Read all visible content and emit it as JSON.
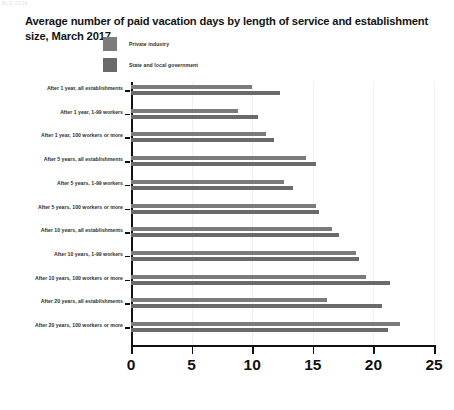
{
  "scan_artifact_text": "BLS 2018",
  "chart_data": {
    "type": "bar",
    "orientation": "horizontal",
    "title": "Average number of paid vacation days by length of service and establishment size, March 2017",
    "xlabel": "",
    "ylabel": "",
    "xlim": [
      0,
      25
    ],
    "xticks": [
      "0",
      "5",
      "10",
      "15",
      "20",
      "25"
    ],
    "grid": true,
    "legend_position": "top",
    "categories": [
      "After 1 year, all establishments",
      "After 1 year, 1-99 workers",
      "After 1 year, 100 workers or more",
      "After 5 years, all establishments",
      "After 5 years, 1-99 workers",
      "After 5 years, 100 workers or more",
      "After 10 years, all establishments",
      "After 10 years, 1-99 workers",
      "After 10 years, 100 workers or more",
      "After 20 years, all establishments",
      "After 20 years, 100 workers or more"
    ],
    "series": [
      {
        "name": "Private industry",
        "color": "#7b7b7b",
        "values": [
          10.0,
          8.8,
          11.1,
          14.4,
          12.6,
          15.3,
          16.6,
          18.6,
          19.4,
          16.2,
          22.2
        ]
      },
      {
        "name": "State and local government",
        "color": "#6a6a6a",
        "values": [
          12.3,
          10.5,
          11.8,
          15.3,
          13.4,
          15.5,
          17.2,
          18.8,
          21.4,
          20.7,
          21.2
        ]
      }
    ]
  }
}
